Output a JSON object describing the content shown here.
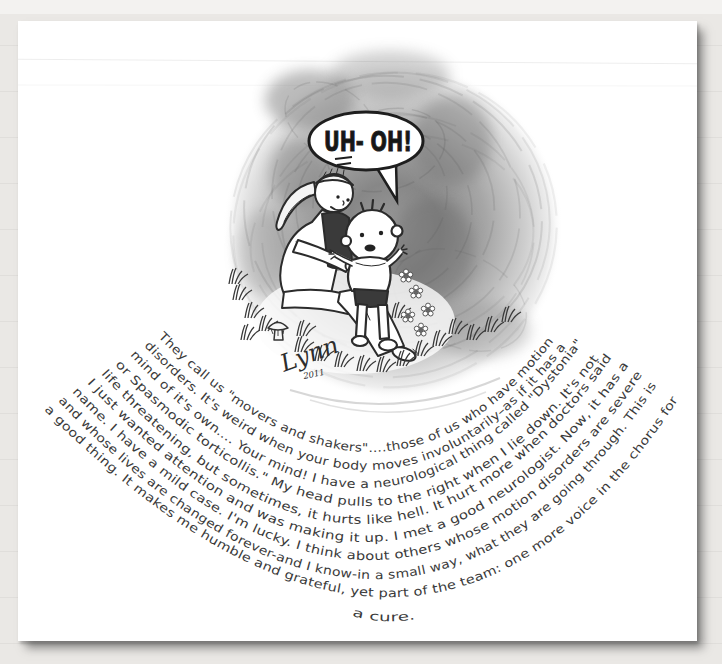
{
  "artwork": {
    "speech_bubble": "UH- OH!",
    "signature": "Lynn",
    "signature_year": "2011",
    "essay_lines": [
      "They call us \"movers and shakers\"....those of us who have motion",
      "disorders. It's weird when your body moves involuntarily–as if it has a",
      "mind of it's own.... Your mind! I have a neurological thing called \"Dystonia\"",
      "or Spasmodic torticollis.\" My head pulls to the right when I lie down. It's not",
      "life threatening, but sometimes, it hurts like hell. It hurt more when doctors said",
      "I just wanted attention and was making it up. I met a good neurologist. Now, it has a",
      "name. I have a mild case. I'm lucky. I think about others whose motion disorders are severe",
      "and whose lives are changed forever-and I know-in a small way, what they are going through. This is",
      "a good thing. It makes me humble and grateful, yet part of the team: one more voice in the chorus for",
      "a cure."
    ]
  },
  "colors": {
    "wall": "#eae8e5",
    "paper": "#ffffff",
    "ink": "#2b2b2b",
    "pencil_shade": "#8f8f8f"
  }
}
